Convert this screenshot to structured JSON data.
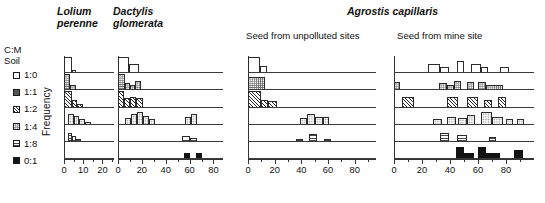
{
  "headers": {
    "lolium": "Lolium\nperenne",
    "lolium_line1": "Lolium",
    "lolium_line2": "perenne",
    "dactylis_line1": "Dactylis",
    "dactylis_line2": "glomerata",
    "agrostis": "Agrostis capillaris",
    "unpolluted": "Seed from unpolluted sites",
    "mine": "Seed from mine site"
  },
  "legend": {
    "title_line1": "C:M",
    "title_line2": "Soil",
    "items": [
      {
        "label": "1:0",
        "swatch": "open-white-square",
        "key": "1:0"
      },
      {
        "label": "1:1",
        "swatch": "fine-dotted-square",
        "key": "1:1"
      },
      {
        "label": "1:2",
        "swatch": "diagonal-hatch-square",
        "key": "1:2"
      },
      {
        "label": "1:4",
        "swatch": "light-stipple-square",
        "key": "1:4"
      },
      {
        "label": "1:8",
        "swatch": "horizontal-line-square",
        "key": "1:8"
      },
      {
        "label": "0:1",
        "swatch": "solid-black-square",
        "key": "0:1"
      }
    ]
  },
  "axes": {
    "ylabel": "Frequency"
  },
  "chart_data": {
    "type": "bar",
    "xlabel": "",
    "ylabel": "Frequency",
    "grid": false,
    "legend_position": "left",
    "row_categories": [
      "1:0",
      "1:1",
      "1:2",
      "1:4",
      "1:8",
      "0:1"
    ],
    "panels": [
      {
        "name": "Lolium perenne",
        "title_line1": "Lolium",
        "title_line2": "perenne",
        "italic_title": true,
        "xlim": [
          0,
          26
        ],
        "xticks": [
          0,
          10,
          20
        ],
        "xticklabels": [
          "0",
          "10",
          "20"
        ],
        "xminor": [
          5,
          15,
          25
        ],
        "bin_width": 2,
        "rows": [
          {
            "category": "1:0",
            "bins": [
              {
                "x0": 0,
                "x1": 4,
                "h": 1.0
              },
              {
                "x0": 4,
                "x1": 6,
                "h": 0.12
              }
            ]
          },
          {
            "category": "1:1",
            "bins": [
              {
                "x0": 0,
                "x1": 3,
                "h": 1.0
              },
              {
                "x0": 3,
                "x1": 6,
                "h": 0.28
              }
            ]
          },
          {
            "category": "1:2",
            "bins": [
              {
                "x0": 0,
                "x1": 4,
                "h": 1.0
              },
              {
                "x0": 4,
                "x1": 7,
                "h": 0.42
              },
              {
                "x0": 7,
                "x1": 10,
                "h": 0.18
              }
            ]
          },
          {
            "category": "1:4",
            "bins": [
              {
                "x0": 2,
                "x1": 5,
                "h": 0.62
              },
              {
                "x0": 5,
                "x1": 8,
                "h": 0.48
              },
              {
                "x0": 8,
                "x1": 11,
                "h": 0.33
              },
              {
                "x0": 11,
                "x1": 14,
                "h": 0.12
              }
            ]
          },
          {
            "category": "1:8",
            "bins": [
              {
                "x0": 2,
                "x1": 4,
                "h": 0.52
              },
              {
                "x0": 4,
                "x1": 6,
                "h": 0.3
              },
              {
                "x0": 6,
                "x1": 9,
                "h": 0.14
              }
            ]
          },
          {
            "category": "0:1",
            "bins": []
          }
        ]
      },
      {
        "name": "Dactylis glomerata",
        "title_line1": "Dactylis",
        "title_line2": "glomerata",
        "italic_title": true,
        "xlim": [
          0,
          88
        ],
        "xticks": [
          0,
          20,
          40,
          60,
          80
        ],
        "xticklabels": [
          "0",
          "20",
          "40",
          "60",
          "80"
        ],
        "xminor": [
          10,
          30,
          50,
          70
        ],
        "bin_width": 5,
        "rows": [
          {
            "category": "1:0",
            "bins": [
              {
                "x0": 0,
                "x1": 9,
                "h": 1.0
              },
              {
                "x0": 9,
                "x1": 18,
                "h": 0.52
              }
            ]
          },
          {
            "category": "1:1",
            "bins": [
              {
                "x0": 0,
                "x1": 6,
                "h": 1.0
              },
              {
                "x0": 6,
                "x1": 10,
                "h": 0.42
              },
              {
                "x0": 10,
                "x1": 14,
                "h": 0.28
              },
              {
                "x0": 14,
                "x1": 19,
                "h": 0.55
              }
            ]
          },
          {
            "category": "1:2",
            "bins": [
              {
                "x0": 0,
                "x1": 5,
                "h": 1.0
              },
              {
                "x0": 5,
                "x1": 10,
                "h": 0.52
              },
              {
                "x0": 10,
                "x1": 15,
                "h": 0.6
              },
              {
                "x0": 15,
                "x1": 21,
                "h": 0.55
              }
            ]
          },
          {
            "category": "1:4",
            "bins": [
              {
                "x0": 6,
                "x1": 11,
                "h": 0.36
              },
              {
                "x0": 11,
                "x1": 16,
                "h": 0.6
              },
              {
                "x0": 16,
                "x1": 21,
                "h": 0.74
              },
              {
                "x0": 21,
                "x1": 26,
                "h": 0.48
              },
              {
                "x0": 26,
                "x1": 31,
                "h": 0.3
              },
              {
                "x0": 56,
                "x1": 61,
                "h": 0.4
              },
              {
                "x0": 61,
                "x1": 66,
                "h": 0.62
              }
            ]
          },
          {
            "category": "1:8",
            "bins": [
              {
                "x0": 54,
                "x1": 60,
                "h": 0.34
              },
              {
                "x0": 60,
                "x1": 66,
                "h": 0.16
              }
            ]
          },
          {
            "category": "0:1",
            "bins": [
              {
                "x0": 55,
                "x1": 60,
                "h": 0.3
              },
              {
                "x0": 65,
                "x1": 70,
                "h": 0.3
              }
            ]
          }
        ]
      },
      {
        "name": "Agrostis capillaris - unpolluted",
        "group_title": "Agrostis capillaris",
        "subtitle": "Seed from unpolluted sites",
        "italic_title": false,
        "xlim": [
          0,
          96
        ],
        "xticks": [
          0,
          20,
          40,
          60,
          80
        ],
        "xticklabels": [
          "0",
          "20",
          "40",
          "60",
          "80"
        ],
        "xminor": [
          10,
          30,
          50,
          70,
          90
        ],
        "bin_width": 5,
        "rows": [
          {
            "category": "1:0",
            "bins": [
              {
                "x0": 0,
                "x1": 9,
                "h": 1.0
              },
              {
                "x0": 9,
                "x1": 14,
                "h": 0.4
              }
            ]
          },
          {
            "category": "1:1",
            "bins": [
              {
                "x0": 0,
                "x1": 13,
                "h": 0.76
              }
            ]
          },
          {
            "category": "1:2",
            "bins": [
              {
                "x0": 0,
                "x1": 10,
                "h": 1.0
              },
              {
                "x0": 10,
                "x1": 15,
                "h": 0.42
              },
              {
                "x0": 15,
                "x1": 22,
                "h": 0.34
              }
            ]
          },
          {
            "category": "1:4",
            "bins": [
              {
                "x0": 39,
                "x1": 44,
                "h": 0.38
              },
              {
                "x0": 44,
                "x1": 50,
                "h": 0.62
              },
              {
                "x0": 50,
                "x1": 56,
                "h": 0.4
              },
              {
                "x0": 56,
                "x1": 61,
                "h": 0.4
              }
            ]
          },
          {
            "category": "1:8",
            "bins": [
              {
                "x0": 36,
                "x1": 41,
                "h": 0.12
              },
              {
                "x0": 46,
                "x1": 52,
                "h": 0.42
              },
              {
                "x0": 57,
                "x1": 62,
                "h": 0.14
              }
            ]
          },
          {
            "category": "0:1",
            "bins": []
          }
        ]
      },
      {
        "name": "Agrostis capillaris - mine site",
        "group_title": "Agrostis capillaris",
        "subtitle": "Seed from mine site",
        "italic_title": false,
        "xlim": [
          0,
          100
        ],
        "xticks": [
          0,
          20,
          40,
          60,
          80
        ],
        "xticklabels": [
          "0",
          "20",
          "40",
          "60",
          "80"
        ],
        "xminor": [
          10,
          30,
          50,
          70,
          90
        ],
        "bin_width": 5,
        "rows": [
          {
            "category": "1:0",
            "bins": [
              {
                "x0": 24,
                "x1": 33,
                "h": 0.52
              },
              {
                "x0": 33,
                "x1": 39,
                "h": 0.3
              },
              {
                "x0": 45,
                "x1": 50,
                "h": 0.72
              },
              {
                "x0": 55,
                "x1": 62,
                "h": 0.52
              },
              {
                "x0": 62,
                "x1": 67,
                "h": 0.3
              },
              {
                "x0": 76,
                "x1": 82,
                "h": 0.34
              }
            ]
          },
          {
            "category": "1:1",
            "bins": [
              {
                "x0": 0,
                "x1": 4,
                "h": 0.5
              },
              {
                "x0": 32,
                "x1": 38,
                "h": 0.4
              },
              {
                "x0": 38,
                "x1": 43,
                "h": 0.28
              },
              {
                "x0": 43,
                "x1": 48,
                "h": 0.52
              },
              {
                "x0": 52,
                "x1": 57,
                "h": 0.44
              },
              {
                "x0": 60,
                "x1": 66,
                "h": 0.5
              },
              {
                "x0": 66,
                "x1": 78,
                "h": 0.3
              }
            ]
          },
          {
            "category": "1:2",
            "bins": [
              {
                "x0": 6,
                "x1": 14,
                "h": 0.6
              },
              {
                "x0": 38,
                "x1": 46,
                "h": 0.6
              },
              {
                "x0": 52,
                "x1": 60,
                "h": 0.6
              },
              {
                "x0": 64,
                "x1": 70,
                "h": 0.42
              },
              {
                "x0": 74,
                "x1": 80,
                "h": 0.58
              }
            ]
          },
          {
            "category": "1:4",
            "bins": [
              {
                "x0": 28,
                "x1": 34,
                "h": 0.3
              },
              {
                "x0": 38,
                "x1": 44,
                "h": 0.4
              },
              {
                "x0": 46,
                "x1": 52,
                "h": 0.36
              },
              {
                "x0": 52,
                "x1": 58,
                "h": 0.58
              },
              {
                "x0": 62,
                "x1": 70,
                "h": 0.74
              },
              {
                "x0": 70,
                "x1": 78,
                "h": 0.4
              },
              {
                "x0": 80,
                "x1": 85,
                "h": 0.3
              },
              {
                "x0": 88,
                "x1": 93,
                "h": 0.3
              }
            ]
          },
          {
            "category": "1:8",
            "bins": [
              {
                "x0": 33,
                "x1": 39,
                "h": 0.52
              },
              {
                "x0": 45,
                "x1": 52,
                "h": 0.38
              },
              {
                "x0": 68,
                "x1": 73,
                "h": 0.26
              }
            ]
          },
          {
            "category": "0:1",
            "bins": [
              {
                "x0": 44,
                "x1": 50,
                "h": 0.72
              },
              {
                "x0": 50,
                "x1": 57,
                "h": 0.3
              },
              {
                "x0": 60,
                "x1": 66,
                "h": 0.72
              },
              {
                "x0": 66,
                "x1": 76,
                "h": 0.34
              },
              {
                "x0": 86,
                "x1": 92,
                "h": 0.52
              }
            ]
          }
        ]
      }
    ]
  }
}
